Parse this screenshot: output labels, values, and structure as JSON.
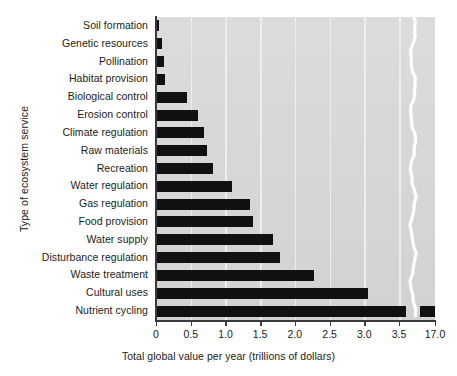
{
  "chart_data": {
    "type": "bar",
    "orientation": "horizontal",
    "title": "",
    "xlabel": "Total global value per year (trillions of dollars)",
    "ylabel": "Type of ecosystem service",
    "categories": [
      "Soil formation",
      "Genetic resources",
      "Pollination",
      "Habitat provision",
      "Biological control",
      "Erosion control",
      "Climate regulation",
      "Raw materials",
      "Recreation",
      "Water regulation",
      "Gas regulation",
      "Food provision",
      "Water supply",
      "Disturbance regulation",
      "Waste treatment",
      "Cultural uses",
      "Nutrient cycling"
    ],
    "values": [
      0.05,
      0.08,
      0.11,
      0.13,
      0.45,
      0.6,
      0.69,
      0.73,
      0.82,
      1.1,
      1.35,
      1.4,
      1.69,
      1.78,
      2.28,
      3.05,
      17.0
    ],
    "xticks": [
      0,
      0.5,
      1.0,
      1.5,
      2.0,
      2.5,
      3.0,
      3.5,
      17.0
    ],
    "xtick_labels": [
      "0",
      "0.5",
      "1.0",
      "1.5",
      "2.0",
      "2.5",
      "3.0",
      "3.5",
      "17.0"
    ],
    "xlim": [
      0,
      17.0
    ],
    "axis_break": {
      "present": true,
      "after": 3.6,
      "resumes_at": 16.6,
      "style": "wavy-white"
    },
    "grid": {
      "vertical": true,
      "horizontal": false
    },
    "legend": {
      "present": false
    },
    "colors": {
      "bar": "#111111",
      "plot_background": "#d7d7d7",
      "gridline": "#f0f0f0",
      "axis": "#3a3a3a",
      "text": "#1b1b1b",
      "figure_background": "#ffffff",
      "break_line": "#ffffff"
    }
  }
}
